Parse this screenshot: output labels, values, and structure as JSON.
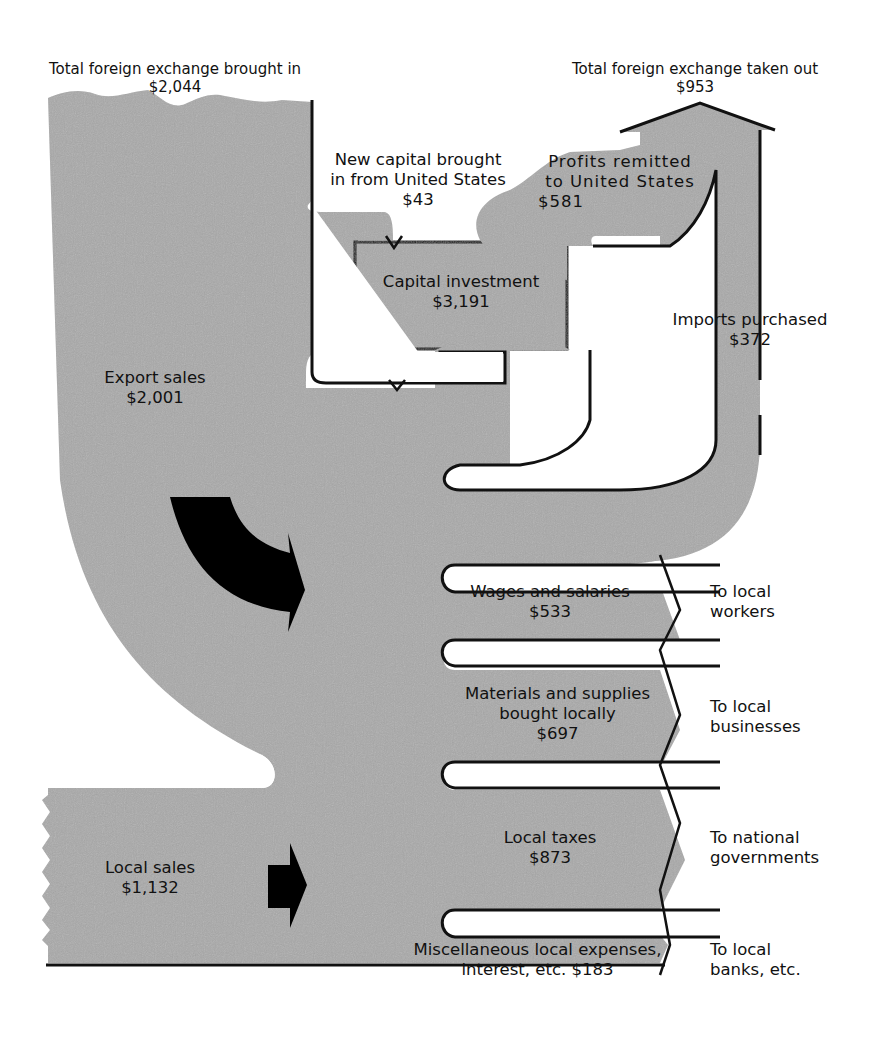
{
  "colors": {
    "flow_fill": "#a9a9a9",
    "outline": "#111111",
    "arrow": "#000000",
    "background": "#ffffff"
  },
  "header": {
    "inflow_title": "Total foreign exchange brought in",
    "inflow_value": "$2,044",
    "outflow_title": "Total foreign exchange taken out",
    "outflow_value": "$953"
  },
  "flows": {
    "new_capital": {
      "line1": "New capital brought",
      "line2": "in from United States",
      "value": "$43"
    },
    "profits": {
      "line1": "Profits remitted",
      "line2": "to United States",
      "value": "$581"
    },
    "capital_investment": {
      "label": "Capital investment",
      "value": "$3,191"
    },
    "imports": {
      "label": "Imports purchased",
      "value": "$372"
    },
    "export_sales": {
      "label": "Export sales",
      "value": "$2,001"
    },
    "local_sales": {
      "label": "Local sales",
      "value": "$1,132"
    }
  },
  "outputs": [
    {
      "line1": "Wages and salaries",
      "line2": "",
      "value": "$533",
      "dest1": "To local",
      "dest2": "workers"
    },
    {
      "line1": "Materials and supplies",
      "line2": "bought locally",
      "value": "$697",
      "dest1": "To local",
      "dest2": "businesses"
    },
    {
      "line1": "Local taxes",
      "line2": "",
      "value": "$873",
      "dest1": "To national",
      "dest2": "governments"
    },
    {
      "line1": "Miscellaneous local expenses,",
      "line2": "interest, etc. $183",
      "value": "",
      "dest1": "To local",
      "dest2": "banks, etc."
    }
  ]
}
